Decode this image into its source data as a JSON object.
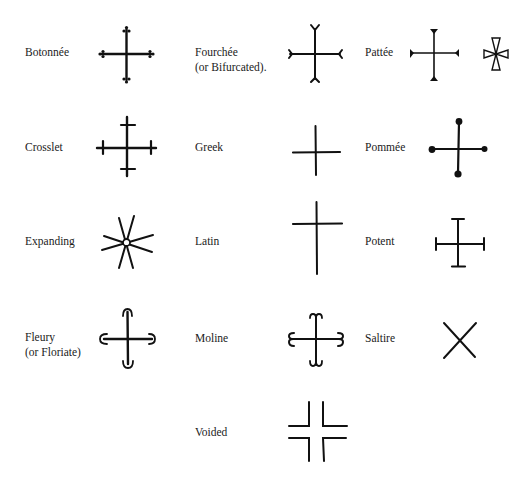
{
  "crosses": [
    {
      "id": "botonnee",
      "label": "Botonnée",
      "label2": ""
    },
    {
      "id": "fourchee",
      "label": "Fourchée",
      "label2": "(or Bifurcated)."
    },
    {
      "id": "pattee",
      "label": "Pattée",
      "label2": ""
    },
    {
      "id": "crosslet",
      "label": "Crosslet",
      "label2": ""
    },
    {
      "id": "greek",
      "label": "Greek",
      "label2": ""
    },
    {
      "id": "pommee",
      "label": "Pommée",
      "label2": ""
    },
    {
      "id": "expanding",
      "label": "Expanding",
      "label2": ""
    },
    {
      "id": "latin",
      "label": "Latin",
      "label2": ""
    },
    {
      "id": "potent",
      "label": "Potent",
      "label2": ""
    },
    {
      "id": "fleury",
      "label": "Fleury",
      "label2": "(or Floriate)"
    },
    {
      "id": "moline",
      "label": "Moline",
      "label2": ""
    },
    {
      "id": "saltire",
      "label": "Saltire",
      "label2": ""
    },
    {
      "id": "voided",
      "label": "Voided",
      "label2": ""
    }
  ],
  "colors": {
    "ink": "#111111",
    "background": "#ffffff"
  }
}
